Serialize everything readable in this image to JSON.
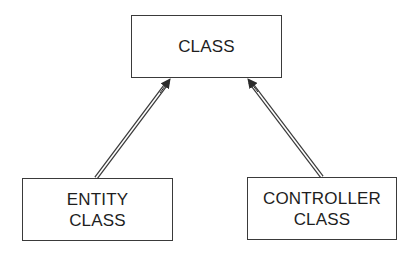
{
  "diagram": {
    "type": "class-hierarchy",
    "nodes": [
      {
        "id": "class",
        "lines": [
          "CLASS"
        ]
      },
      {
        "id": "entity",
        "lines": [
          "ENTITY",
          "CLASS"
        ]
      },
      {
        "id": "controller",
        "lines": [
          "CONTROLLER",
          "CLASS"
        ]
      }
    ],
    "edges": [
      {
        "from": "entity",
        "to": "class",
        "style": "double-line-arrow"
      },
      {
        "from": "controller",
        "to": "class",
        "style": "double-line-arrow"
      }
    ]
  },
  "colors": {
    "stroke": "#3a3a3a",
    "text": "#1e1e1e",
    "background": "#ffffff"
  }
}
